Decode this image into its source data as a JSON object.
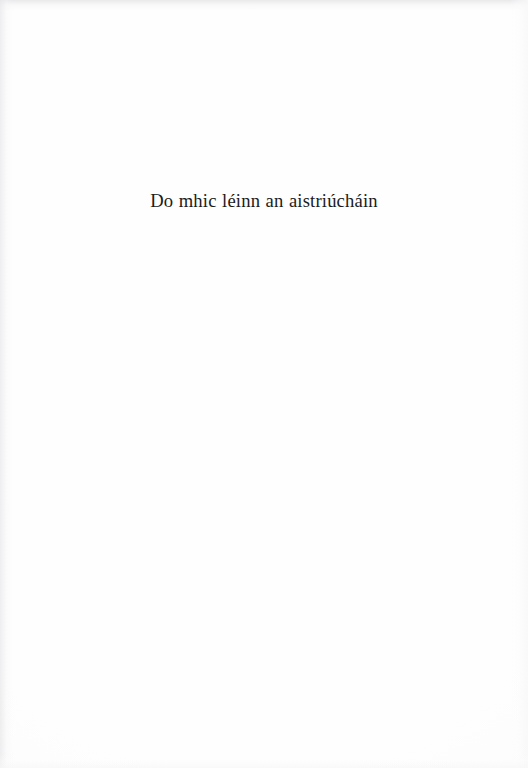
{
  "page": {
    "kind": "book-dedication-page",
    "background_color": "#fefefe",
    "text_color": "#1b1b1b",
    "edge_shade_color": "#e7e7e9"
  },
  "dedication": {
    "line": "Do mhic léinn an aistriúcháin",
    "language": "Irish (Gaeilge)"
  }
}
